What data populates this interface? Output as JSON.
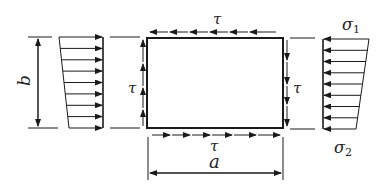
{
  "diagram": {
    "type": "plate stress element",
    "labels": {
      "tau_top": "τ",
      "tau_bottom": "τ",
      "tau_left": "τ",
      "tau_right": "τ",
      "width": "a",
      "height": "b",
      "sigma1": "σ",
      "sigma1_sub": "1",
      "sigma2": "σ",
      "sigma2_sub": "2"
    },
    "colors": {
      "stroke": "#1a1a1a",
      "background": "#ffffff"
    },
    "plate": {
      "x": 147,
      "y": 38,
      "width": 136,
      "height": 90
    },
    "shear": {
      "top": "arrows pointing left along top edge",
      "bottom": "arrows pointing right along bottom edge",
      "left": "arrows pointing up along left edge",
      "right": "arrows pointing down along right edge"
    },
    "normal_stress": {
      "left": "linearly varying distribution, arrows pointing right",
      "right": "linearly varying distribution, arrows pointing left, sigma1 at top, sigma2 at bottom"
    }
  }
}
